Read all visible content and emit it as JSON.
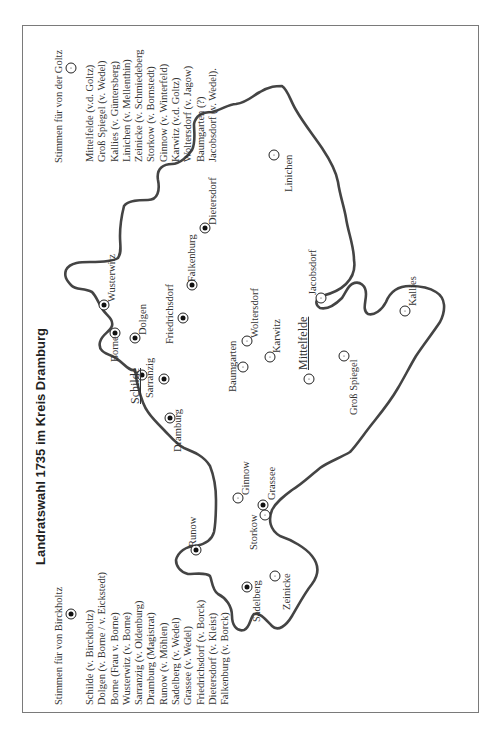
{
  "title": "Landratswahl 1735 im Kreis Dramburg",
  "legend_birckholtz": {
    "heading": "Stimmen für von Birckholtz",
    "marker": "filled-circle-marker",
    "items": [
      "Schilde (v. Birckholtz)",
      "Dolgen (v. Borne / v. Eickstedt)",
      "Borne (Frau v. Borne)",
      "Wusterwitz (v. Borne)",
      "Sarranzig (v. Oldenburg)",
      "Dramburg (Magistrat)",
      "Runow (v. Möhlen)",
      "Sadelberg (v. Wedel)",
      "Grassee (v. Wedel)",
      "Friedrichsdorf (v. Borck)",
      "Dietersdorf (v. Kleist)",
      "Falkenburg (v. Borck)"
    ]
  },
  "legend_goltz": {
    "heading": "Stimmen für von der Goltz",
    "marker": "dot-circle-marker",
    "items": [
      "Mittelfelde (v.d. Goltz)",
      "Groß Spiegel (v. Wedel)",
      "Kallies (v. Güntersberg)",
      "Linichen (v. Mellenthin)",
      "Zeinicke (v. Schmiedeberg",
      "Storkow (v. Bornstedt)",
      "Ginnow (v. Winterfeld)",
      "Karwitz (v.d. Goltz)",
      "Woltersdorf (v. Jagow)",
      "Baumgarten (?)",
      "Jacobsdorf (v. Wedel)."
    ]
  },
  "places": {
    "schilde": "Schilde",
    "sarranzig": "Sarranzig",
    "borne": "Borne",
    "dolgen": "Dolgen",
    "wusterwitz": "Wusterwitz",
    "dramburg": "Dramburg",
    "friedrichsdorf": "Friedrichsdorf",
    "falkenburg": "Falkenburg",
    "dietersdorf": "Dietersdorf",
    "runow": "Runow",
    "sadelberg": "Sadelberg",
    "grassee": "Grassee",
    "baumgarten": "Baumgarten",
    "woltersdorf": "Woltersdorf",
    "karwitz": "Karwitz",
    "mittelfelde": "Mittelfelde",
    "gross_spiegel": "Groß Spiegel",
    "jacobsdorf": "Jacobsdorf",
    "linichen": "Linichen",
    "kallies": "Kallies",
    "ginnow": "Ginnow",
    "storkow": "Storkow",
    "zeinicke": "Zeinicke"
  },
  "colors": {
    "border_line": "#444444",
    "frame": "#7a7a7a",
    "text": "#333333"
  }
}
